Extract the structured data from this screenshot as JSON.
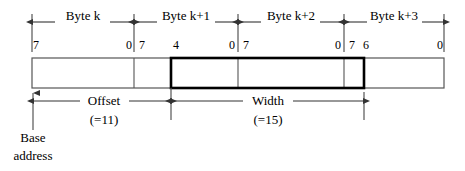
{
  "diagram": {
    "byte_labels": [
      {
        "text": "Byte k",
        "x": 83,
        "y": 16
      },
      {
        "text": "Byte k+1",
        "x": 186,
        "y": 16
      },
      {
        "text": "Byte k+2",
        "x": 291,
        "y": 16
      },
      {
        "text": "Byte k+3",
        "x": 394,
        "y": 16
      }
    ],
    "bit_labels": [
      {
        "text": "7",
        "x": 36,
        "y": 38
      },
      {
        "text": "0",
        "x": 129,
        "y": 38
      },
      {
        "text": "7",
        "x": 142,
        "y": 38
      },
      {
        "text": "4",
        "x": 176,
        "y": 38
      },
      {
        "text": "0",
        "x": 232,
        "y": 38
      },
      {
        "text": "7",
        "x": 246,
        "y": 38
      },
      {
        "text": "0",
        "x": 338,
        "y": 38
      },
      {
        "text": "7",
        "x": 352,
        "y": 38
      },
      {
        "text": "6",
        "x": 366,
        "y": 38
      },
      {
        "text": "0",
        "x": 440,
        "y": 38
      }
    ],
    "measure_labels": [
      {
        "name": "offset",
        "text": "Offset",
        "x": 104,
        "y": 98
      },
      {
        "name": "offset-value",
        "text": "(=11)",
        "x": 104,
        "y": 117
      },
      {
        "name": "width",
        "text": "Width",
        "x": 268,
        "y": 98
      },
      {
        "name": "width-value",
        "text": "(=15)",
        "x": 268,
        "y": 117
      }
    ],
    "base_address_label": [
      {
        "text": "Base",
        "x": 33,
        "y": 136
      },
      {
        "text": "address",
        "x": 33,
        "y": 154
      }
    ],
    "geometry": {
      "bar_left": 32,
      "bar_right": 444,
      "bar_top": 58,
      "bar_bottom": 88,
      "byte_boundaries": [
        134,
        238,
        344
      ],
      "field_left": 171,
      "field_right": 364,
      "tick_top": 14,
      "tick_bottom": 52,
      "byte_rule_y": 22,
      "measure_y": 101,
      "base_line_bottom": 130
    },
    "colors": {
      "background": "#ffffff",
      "stroke": "#333333",
      "bar_stroke": "#555555",
      "field_stroke": "#000000",
      "text": "#000000"
    }
  }
}
